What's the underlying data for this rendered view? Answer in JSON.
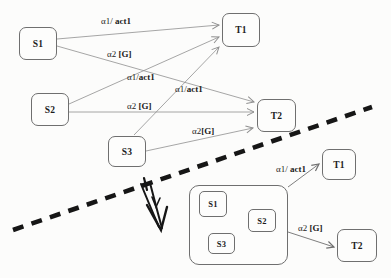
{
  "colors": {
    "background": "#fcfcfb",
    "box_border": "#6f6f6f",
    "edge_line": "#8f8f8f",
    "text": "#1c1c1c",
    "divider": "#161616",
    "annotation_arrow": "#161616"
  },
  "top_diagram": {
    "nodes": [
      {
        "id": "S1",
        "label": "S1"
      },
      {
        "id": "S2",
        "label": "S2"
      },
      {
        "id": "S3",
        "label": "S3"
      },
      {
        "id": "T1",
        "label": "T1"
      },
      {
        "id": "T2",
        "label": "T2"
      }
    ],
    "edges": [
      {
        "from": "S1",
        "to": "T1",
        "plain": "α1/ ",
        "bold": "act1"
      },
      {
        "from": "S1",
        "to": "T2",
        "plain": "α2 ",
        "bold": "[G]"
      },
      {
        "from": "S2",
        "to": "T1",
        "plain": "α1/",
        "bold": "act1"
      },
      {
        "from": "S2",
        "to": "T2",
        "plain": "α2 ",
        "bold": "[G]"
      },
      {
        "from": "S3",
        "to": "T1",
        "plain": "α1/",
        "bold": "act1"
      },
      {
        "from": "S3",
        "to": "T2",
        "plain": "α2",
        "bold": "[G]"
      }
    ]
  },
  "bottom_diagram": {
    "composite_state_nodes": [
      {
        "id": "S1",
        "label": "S1"
      },
      {
        "id": "S2",
        "label": "S2"
      },
      {
        "id": "S3",
        "label": "S3"
      }
    ],
    "target_nodes": [
      {
        "id": "T1",
        "label": "T1"
      },
      {
        "id": "T2",
        "label": "T2"
      }
    ],
    "edges": [
      {
        "from": "composite",
        "to": "T1",
        "plain": "α1/ ",
        "bold": "act1"
      },
      {
        "from": "composite",
        "to": "T2",
        "plain": "α2 ",
        "bold": "[G]"
      }
    ]
  }
}
